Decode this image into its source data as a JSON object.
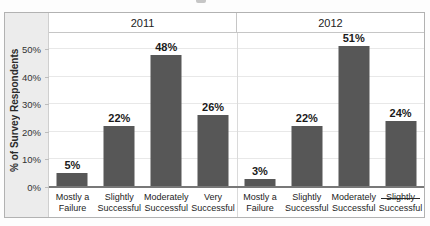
{
  "page": {
    "top_crop_fragment": "partial cropped text remnant at top center"
  },
  "colors": {
    "bar": "#575757",
    "axis_band_bg": "#ececec",
    "plot_bg": "#ffffff",
    "baseline": "#787878",
    "gridline": "#e8e8e8",
    "border": "#b2b2b2"
  },
  "chart_data": {
    "type": "bar",
    "title": "",
    "ylabel": "% of Survey Respondents",
    "xlabel": "",
    "ylim": [
      0,
      55
    ],
    "grid": true,
    "legend_position": "none",
    "yticks": [
      {
        "value": 0,
        "label": "0%"
      },
      {
        "value": 10,
        "label": "10%"
      },
      {
        "value": 20,
        "label": "20%"
      },
      {
        "value": 30,
        "label": "30%"
      },
      {
        "value": 40,
        "label": "40%"
      },
      {
        "value": 50,
        "label": "50%"
      }
    ],
    "panels": [
      {
        "label": "2011",
        "bars": [
          {
            "category_line1": "Mostly a",
            "category_line2": "Failure",
            "value": 5,
            "data_label": "5%",
            "struck": false
          },
          {
            "category_line1": "Slightly",
            "category_line2": "Successful",
            "value": 22,
            "data_label": "22%",
            "struck": false
          },
          {
            "category_line1": "Moderately",
            "category_line2": "Successful",
            "value": 48,
            "data_label": "48%",
            "struck": false
          },
          {
            "category_line1": "Very",
            "category_line2": "Successful",
            "value": 26,
            "data_label": "26%",
            "struck": false
          }
        ]
      },
      {
        "label": "2012",
        "bars": [
          {
            "category_line1": "Mostly a",
            "category_line2": "Failure",
            "value": 3,
            "data_label": "3%",
            "struck": false
          },
          {
            "category_line1": "Slightly",
            "category_line2": "Successful",
            "value": 22,
            "data_label": "22%",
            "struck": false
          },
          {
            "category_line1": "Moderately",
            "category_line2": "Successful",
            "value": 51,
            "data_label": "51%",
            "struck": false
          },
          {
            "category_line1": "Slightly",
            "category_line2": "Successful",
            "value": 24,
            "data_label": "24%",
            "struck": true
          }
        ]
      }
    ]
  }
}
